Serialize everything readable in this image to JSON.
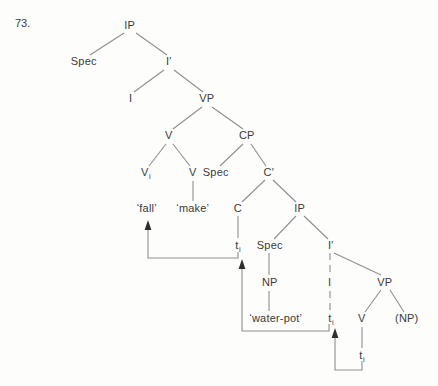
{
  "figure_label": "73.",
  "colors": {
    "background": "#fdfdfc",
    "text": "#3a3a3a",
    "branch_line": "#8f8f8f",
    "arrow_line": "#8f8f8f",
    "arrowhead": "#2e2e2e"
  },
  "tree": {
    "type": "syntax-tree",
    "nodes": [
      {
        "id": "ip-matrix",
        "label": "IP"
      },
      {
        "id": "spec-matrix",
        "label": "Spec"
      },
      {
        "id": "i-bar-matrix",
        "label": "I′"
      },
      {
        "id": "i-matrix",
        "label": "I"
      },
      {
        "id": "vp-matrix",
        "label": "VP"
      },
      {
        "id": "v-upper",
        "label": "V"
      },
      {
        "id": "cp",
        "label": "CP"
      },
      {
        "id": "v-head-i",
        "label": "V",
        "sub": "i"
      },
      {
        "id": "v-make-parent",
        "label": "V"
      },
      {
        "id": "spec-cp",
        "label": "Spec"
      },
      {
        "id": "c-bar",
        "label": "C′"
      },
      {
        "id": "word-fall",
        "label": "‘fall’"
      },
      {
        "id": "word-make",
        "label": "‘make’"
      },
      {
        "id": "c-head",
        "label": "C"
      },
      {
        "id": "ip-embedded",
        "label": "IP"
      },
      {
        "id": "trace-under-c",
        "label": "t",
        "sub": "i"
      },
      {
        "id": "spec-embedded",
        "label": "Spec"
      },
      {
        "id": "i-bar-embedded",
        "label": "I′"
      },
      {
        "id": "np",
        "label": "NP"
      },
      {
        "id": "i-embedded",
        "label": "I"
      },
      {
        "id": "vp-embedded",
        "label": "VP"
      },
      {
        "id": "word-water-pot",
        "label": "‘water-pot’"
      },
      {
        "id": "trace-under-i",
        "label": "t",
        "sub": "i"
      },
      {
        "id": "v-lower",
        "label": "V"
      },
      {
        "id": "np-optional",
        "label": "(NP)"
      },
      {
        "id": "trace-under-v",
        "label": "t",
        "sub": "i"
      }
    ],
    "movement_arrows": [
      {
        "from": "trace-under-v",
        "to": "trace-under-i"
      },
      {
        "from": "trace-under-i",
        "to": "trace-under-c"
      },
      {
        "from": "trace-under-c",
        "to": "word-fall"
      }
    ]
  }
}
